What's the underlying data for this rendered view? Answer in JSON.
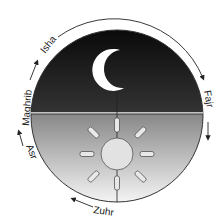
{
  "diagram": {
    "labels": {
      "fajr": "Fajr",
      "zuhr": "Zuhr",
      "asr": "Asr",
      "maghrib": "Maghrib",
      "isha": "Isha"
    },
    "icons": {
      "night": "crescent-moon-icon",
      "day": "sun-icon"
    },
    "colors": {
      "night_dark": "#0a0a0a",
      "night_light": "#d8d8d8",
      "day_dark": "#3a3a3a",
      "day_light": "#f2f2f2",
      "sun": "#e0e0e0",
      "moon": "#ffffff"
    }
  }
}
